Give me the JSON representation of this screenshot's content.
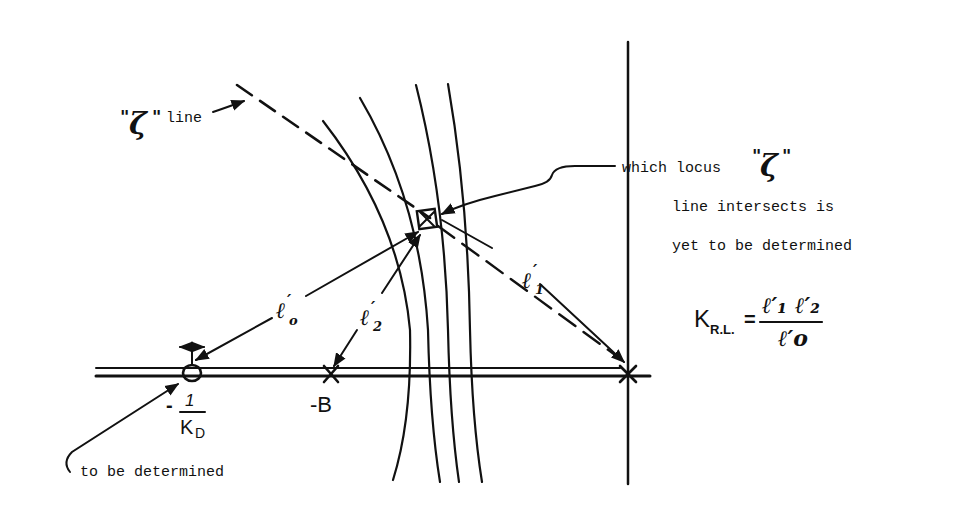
{
  "diagram": {
    "type": "root-locus-sketch",
    "labels": {
      "zeta_line": {
        "quote_open": "\"",
        "symbol": "ζ",
        "quote_close": "\"",
        "text": "line"
      },
      "annotation_right": {
        "line1_prefix": "which locus",
        "line1_quote_open": "\"",
        "line1_symbol": "ζ",
        "line1_quote_close": "\"",
        "line2": "line intersects is",
        "line3": "yet to be determined"
      },
      "annotation_bottom": "to be determined",
      "zero_label": {
        "sign": "-",
        "numerator": "1",
        "denominator_main": "K",
        "denominator_sub": "D"
      },
      "pole_label": "-B",
      "l0": {
        "base": "ℓ",
        "prime": "′",
        "sub": "o"
      },
      "l1": {
        "base": "ℓ",
        "prime": "′",
        "sub": "1"
      },
      "l2": {
        "base": "ℓ",
        "prime": "′",
        "sub": "2"
      },
      "formula": {
        "lhs_main": "K",
        "lhs_sub": "R.L.",
        "equals": "=",
        "num_1": "ℓ′₁",
        "num_2": "ℓ′₂",
        "den": "ℓ′o"
      }
    },
    "elements": {
      "real_axis": "horizontal double line",
      "imaginary_axis": "vertical line at origin",
      "pole_origin": "×",
      "pole_minus_B": "×",
      "zero_minus_1_over_KD": "○ with movable arrow",
      "test_point": "boxed ×",
      "locus_curves_count": 4
    },
    "colors": {
      "ink": "#111111",
      "background": "#ffffff"
    }
  }
}
